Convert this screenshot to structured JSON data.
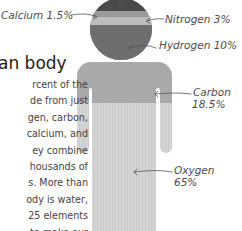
{
  "heading": {
    "title": "an body"
  },
  "paragraph": {
    "lines": [
      "rcent of the",
      "de from just",
      "gen, carbon,",
      "calcium, and",
      "ey combine",
      "housands of",
      "s. More than",
      "ody is water,",
      "25 elements",
      "to make our"
    ]
  },
  "elements": [
    {
      "name": "Calcium",
      "label": "Calcium 1.5%",
      "percent": 1.5,
      "color": "#9a9a9a"
    },
    {
      "name": "Nitrogen",
      "label": "Nitrogen 3%",
      "percent": 3,
      "color": "#b8b8b8"
    },
    {
      "name": "Hydrogen",
      "label": "Hydrogen 10%",
      "percent": 10,
      "color": "#6e6e6e"
    },
    {
      "name": "Carbon",
      "label_line1": "Carbon",
      "label_line2": "18.5%",
      "percent": 18.5,
      "color": "#a9a9a9"
    },
    {
      "name": "Oxygen",
      "label_line1": "Oxygen",
      "label_line2": "65%",
      "percent": 65,
      "color": "#d0d0d0"
    }
  ],
  "colors": {
    "head_top": "#4a4a4a",
    "calcium_band": "#9a9a9a",
    "nitrogen_band": "#b8b8b8",
    "hydrogen": "#6e6e6e",
    "carbon": "#a9a9a9",
    "oxygen": "#d0d0d0"
  }
}
